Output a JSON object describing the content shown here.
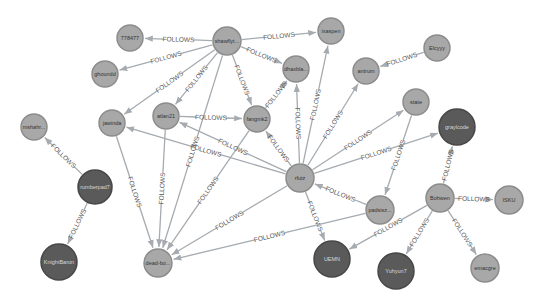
{
  "graph": {
    "relationship_type": "FOLLOWS",
    "colors": {
      "background": "#ffffff",
      "edge": "#a5abb0",
      "node_light": "#a8a8a8",
      "node_dark": "#5a5a5a"
    },
    "nodes": [
      {
        "id": "n778477",
        "label": "778477",
        "x": 130,
        "y": 38,
        "r": 13,
        "style": "light"
      },
      {
        "id": "nshawfly",
        "label": "shawflyt...",
        "x": 227,
        "y": 41,
        "r": 14,
        "style": "light"
      },
      {
        "id": "nixaspen",
        "label": "ixaspen",
        "x": 331,
        "y": 31,
        "r": 13,
        "style": "light"
      },
      {
        "id": "nghoundd",
        "label": "ghoundd",
        "x": 105,
        "y": 74,
        "r": 13,
        "style": "light"
      },
      {
        "id": "ndhaxb",
        "label": "dhaxbla...",
        "x": 296,
        "y": 69,
        "r": 13,
        "style": "light"
      },
      {
        "id": "nantrum",
        "label": "antrum",
        "x": 366,
        "y": 71,
        "r": 13,
        "style": "light"
      },
      {
        "id": "nelcyyy",
        "label": "Elcyyy",
        "x": 437,
        "y": 48,
        "r": 13,
        "style": "light"
      },
      {
        "id": "nstate",
        "label": "state",
        "x": 416,
        "y": 102,
        "r": 13,
        "style": "light"
      },
      {
        "id": "njawinda",
        "label": "jawinda",
        "x": 112,
        "y": 123,
        "r": 13,
        "style": "light"
      },
      {
        "id": "natlan21",
        "label": "atlan21",
        "x": 166,
        "y": 116,
        "r": 13,
        "style": "light"
      },
      {
        "id": "nfangmk2",
        "label": "fangmk2",
        "x": 257,
        "y": 119,
        "r": 13,
        "style": "light"
      },
      {
        "id": "nmshahr",
        "label": "mshahr...",
        "x": 34,
        "y": 127,
        "r": 13,
        "style": "light"
      },
      {
        "id": "nrfutz",
        "label": "rfutz",
        "x": 300,
        "y": 178,
        "r": 14,
        "style": "light"
      },
      {
        "id": "ngraylcode",
        "label": "graylcode",
        "x": 457,
        "y": 127,
        "r": 18,
        "style": "dark"
      },
      {
        "id": "nrumberpad",
        "label": "rumberpad7",
        "x": 95,
        "y": 187,
        "r": 17,
        "style": "dark"
      },
      {
        "id": "npadsisz",
        "label": "padsisz...",
        "x": 380,
        "y": 210,
        "r": 14,
        "style": "light"
      },
      {
        "id": "nbohwen",
        "label": "Bohwen",
        "x": 440,
        "y": 198,
        "r": 14,
        "style": "light"
      },
      {
        "id": "nisku",
        "label": "ISKU",
        "x": 509,
        "y": 200,
        "r": 14,
        "style": "light"
      },
      {
        "id": "nknightbaron",
        "label": "KnightBaron",
        "x": 59,
        "y": 262,
        "r": 18,
        "style": "dark"
      },
      {
        "id": "ndeadbo",
        "label": "dead-bo...",
        "x": 158,
        "y": 263,
        "r": 14,
        "style": "light"
      },
      {
        "id": "nuemn",
        "label": "UEMN",
        "x": 332,
        "y": 259,
        "r": 18,
        "style": "dark"
      },
      {
        "id": "nyuhyun7",
        "label": "Yuhyun7",
        "x": 396,
        "y": 271,
        "r": 18,
        "style": "dark"
      },
      {
        "id": "nemacgre",
        "label": "emacgre",
        "x": 485,
        "y": 268,
        "r": 14,
        "style": "light"
      }
    ],
    "edges": [
      {
        "from": "nshawfly",
        "to": "n778477",
        "label": "FOLLOWS"
      },
      {
        "from": "nshawfly",
        "to": "nixaspen",
        "label": "FOLLOWS"
      },
      {
        "from": "nshawfly",
        "to": "nghoundd",
        "label": "FOLLOWS"
      },
      {
        "from": "nshawfly",
        "to": "ndhaxb",
        "label": "FOLLOWS"
      },
      {
        "from": "nshawfly",
        "to": "njawinda",
        "label": "FOLLOWS"
      },
      {
        "from": "nshawfly",
        "to": "natlan21",
        "label": "FOLLOWS"
      },
      {
        "from": "nshawfly",
        "to": "nfangmk2",
        "label": "FOLLOWS"
      },
      {
        "from": "nshawfly",
        "to": "ndeadbo",
        "label": "FOLLOWS"
      },
      {
        "from": "nelcyyy",
        "to": "nantrum",
        "label": "FOLLOWS"
      },
      {
        "from": "natlan21",
        "to": "nfangmk2",
        "label": "FOLLOWS"
      },
      {
        "from": "natlan21",
        "to": "ndeadbo",
        "label": "FOLLOWS"
      },
      {
        "from": "njawinda",
        "to": "ndeadbo",
        "label": "FOLLOWS"
      },
      {
        "from": "nfangmk2",
        "to": "ndhaxb",
        "label": "FOLLOWS"
      },
      {
        "from": "nfangmk2",
        "to": "ndeadbo",
        "label": "FOLLOWS"
      },
      {
        "from": "nrfutz",
        "to": "nfangmk2",
        "label": "FOLLOWS"
      },
      {
        "from": "nrfutz",
        "to": "natlan21",
        "label": "FOLLOWS"
      },
      {
        "from": "nrfutz",
        "to": "njawinda",
        "label": "FOLLOWS"
      },
      {
        "from": "nrfutz",
        "to": "ndhaxb",
        "label": "FOLLOWS"
      },
      {
        "from": "nrfutz",
        "to": "nixaspen",
        "label": "FOLLOWS"
      },
      {
        "from": "nrfutz",
        "to": "nantrum",
        "label": "FOLLOWS"
      },
      {
        "from": "nrfutz",
        "to": "nstate",
        "label": "FOLLOWS"
      },
      {
        "from": "nrfutz",
        "to": "ngraylcode",
        "label": "FOLLOWS"
      },
      {
        "from": "nrfutz",
        "to": "ndeadbo",
        "label": "FOLLOWS"
      },
      {
        "from": "nrfutz",
        "to": "nuemn",
        "label": "FOLLOWS"
      },
      {
        "from": "npadsisz",
        "to": "nrfutz",
        "label": "FOLLOWS"
      },
      {
        "from": "npadsisz",
        "to": "ndeadbo",
        "label": "FOLLOWS"
      },
      {
        "from": "nstate",
        "to": "npadsisz",
        "label": "FOLLOWS"
      },
      {
        "from": "nrumberpad",
        "to": "nmshahr",
        "label": "FOLLOWS"
      },
      {
        "from": "nrumberpad",
        "to": "nknightbaron",
        "label": "FOLLOWS"
      },
      {
        "from": "nbohwen",
        "to": "ngraylcode",
        "label": "FOLLOWS"
      },
      {
        "from": "nbohwen",
        "to": "nisku",
        "label": "FOLLOWS"
      },
      {
        "from": "nbohwen",
        "to": "nuemn",
        "label": "FOLLOWS"
      },
      {
        "from": "nbohwen",
        "to": "nyuhyun7",
        "label": "FOLLOWS"
      },
      {
        "from": "nbohwen",
        "to": "nemacgre",
        "label": "FOLLOWS"
      }
    ]
  }
}
